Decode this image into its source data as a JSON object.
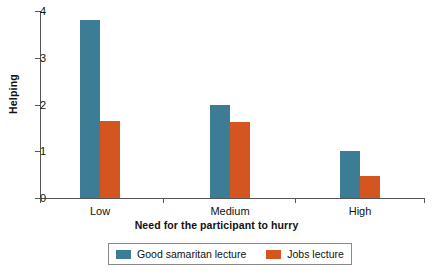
{
  "chart_data": {
    "type": "bar",
    "title": "",
    "subtitle": "",
    "xlabel": "Need for the participant to hurry",
    "ylabel": "Helping",
    "categories": [
      "Low",
      "Medium",
      "High"
    ],
    "series": [
      {
        "name": "Good samaritan lecture",
        "color": "#3c7c94",
        "values": [
          3.8,
          2.0,
          1.0
        ]
      },
      {
        "name": "Jobs lecture",
        "color": "#d4551f",
        "values": [
          1.65,
          1.63,
          0.47
        ]
      }
    ],
    "ylim": [
      0,
      4
    ],
    "yticks": [
      0,
      1,
      2,
      3,
      4
    ],
    "ytick_labels": [
      "0",
      "1",
      "2",
      "3",
      "4"
    ],
    "grid": false,
    "legend_position": "bottom"
  },
  "axes": {
    "y_axis_title": "Helping",
    "x_axis_title": "Need for the participant to hurry"
  },
  "legend": {
    "entries": [
      {
        "label": "Good samaritan lecture",
        "swatch": "legend-swatch-blue"
      },
      {
        "label": "Jobs lecture",
        "swatch": "legend-swatch-orange"
      }
    ]
  },
  "colors": {
    "series_good_samaritan": "#3c7c94",
    "series_jobs": "#d4551f",
    "axis": "#555555",
    "background": "#ffffff",
    "text": "#111111"
  }
}
